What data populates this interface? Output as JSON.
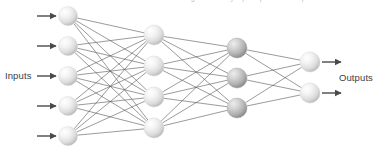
{
  "diagram": {
    "caption_clipped": "a single hidden layer perceptron with outputs",
    "labels": {
      "inputs": "Inputs",
      "outputs": "Outputs"
    },
    "colors": {
      "background": "#ffffff",
      "edge": "#4a4a4a",
      "arrow": "#4a4a4a",
      "node_light_center": "#ffffff",
      "node_light_mid": "#e4e4e4",
      "node_light_edge": "#bdbdbd",
      "node_dark_center": "#e8e8e8",
      "node_dark_mid": "#bdbdbd",
      "node_dark_edge": "#8f8f8f",
      "label_text": "#3d3d3d"
    },
    "layers": [
      {
        "id": "input-layer",
        "name": "Inputs",
        "shade": "light",
        "node_count": 5,
        "x": 68,
        "radius": 9.5,
        "node_y": [
          16,
          46,
          76,
          106,
          136
        ]
      },
      {
        "id": "hidden-layer-1",
        "name": "Hidden layer 1",
        "shade": "light",
        "node_count": 4,
        "x": 154,
        "radius": 10,
        "node_y": [
          35,
          66,
          97,
          128
        ]
      },
      {
        "id": "hidden-layer-2",
        "name": "Hidden layer 2",
        "shade": "dark",
        "node_count": 3,
        "x": 237,
        "radius": 10,
        "node_y": [
          48,
          78,
          108
        ]
      },
      {
        "id": "output-layer",
        "name": "Outputs",
        "shade": "light",
        "node_count": 2,
        "x": 310,
        "radius": 10,
        "node_y": [
          62,
          93
        ]
      }
    ],
    "connections": [
      {
        "from": "input-layer",
        "to": "hidden-layer-1",
        "fully_connected": true,
        "edge_count": 20
      },
      {
        "from": "hidden-layer-1",
        "to": "hidden-layer-2",
        "fully_connected": true,
        "edge_count": 12
      },
      {
        "from": "hidden-layer-2",
        "to": "output-layer",
        "fully_connected": true,
        "edge_count": 6
      }
    ],
    "input_arrows": {
      "count": 5,
      "x_start": 37,
      "x_end": 56,
      "y": [
        16,
        46,
        76,
        106,
        136
      ]
    },
    "output_arrows": {
      "count": 2,
      "x_start": 322,
      "x_end": 341,
      "y": [
        62,
        93
      ]
    }
  }
}
